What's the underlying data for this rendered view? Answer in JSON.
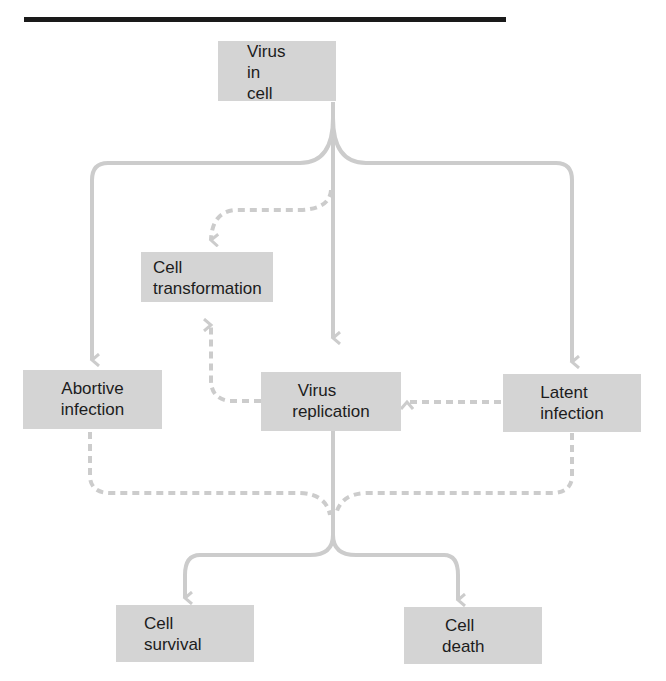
{
  "diagram": {
    "type": "flowchart",
    "colors": {
      "box_fill": "#d4d4d4",
      "arrow": "#cccccc",
      "text": "#1c1c1c",
      "rule": "#1a1a1a"
    },
    "nodes": {
      "virus_in_cell": {
        "lines": [
          "Virus",
          "in",
          "cell"
        ]
      },
      "cell_transformation": {
        "lines": [
          "Cell",
          "transformation"
        ]
      },
      "abortive_infection": {
        "lines": [
          "Abortive",
          "infection"
        ]
      },
      "virus_replication": {
        "lines": [
          "Virus",
          "replication"
        ]
      },
      "latent_infection": {
        "lines": [
          "Latent",
          "infection"
        ]
      },
      "cell_survival": {
        "lines": [
          "Cell",
          "survival"
        ]
      },
      "cell_death": {
        "lines": [
          "Cell",
          "death"
        ]
      }
    },
    "edges": [
      {
        "from": "virus_in_cell",
        "to": "abortive_infection",
        "style": "solid"
      },
      {
        "from": "virus_in_cell",
        "to": "virus_replication",
        "style": "solid"
      },
      {
        "from": "virus_in_cell",
        "to": "latent_infection",
        "style": "solid"
      },
      {
        "from": "virus_in_cell",
        "to": "cell_transformation",
        "style": "dashed"
      },
      {
        "from": "virus_replication",
        "to": "cell_transformation",
        "style": "dashed"
      },
      {
        "from": "latent_infection",
        "to": "virus_replication",
        "style": "dashed"
      },
      {
        "from": "abortive_infection",
        "to": "cell_survival|cell_death",
        "style": "dashed"
      },
      {
        "from": "latent_infection",
        "to": "cell_survival|cell_death",
        "style": "dashed"
      },
      {
        "from": "virus_replication",
        "to": "cell_survival",
        "style": "solid"
      },
      {
        "from": "virus_replication",
        "to": "cell_death",
        "style": "solid"
      }
    ]
  }
}
